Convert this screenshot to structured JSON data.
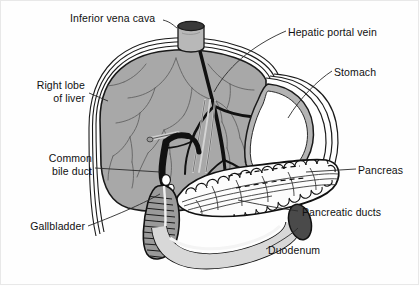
{
  "figure": {
    "type": "labeled-anatomical-illustration",
    "background_color": "#fefefe",
    "border_color": "#e8e8e8"
  },
  "palette": {
    "liver_fill": "#a8a8a8",
    "liver_outline": "#1a1a1a",
    "stomach_fill": "#ffffff",
    "stomach_rim": "#b4b4b4",
    "pancreas_fill": "#fcfcfc",
    "pancreas_outline": "#111111",
    "duodenum_fill": "#d8d8d8",
    "duodenum_dark": "#4a4a4a",
    "gallbladder_fill": "#9a9a9a",
    "vessel_dark": "#111111",
    "vessel_light": "#6a6a6a",
    "vena_cava_top": "#3a3a3a",
    "label_text": "#101010",
    "leader_line": "#2a2a2a"
  },
  "labels": [
    {
      "id": "inferior-vena-cava",
      "text": "Inferior vena cava",
      "lines": [
        "Inferior vena cava"
      ],
      "align": "left",
      "x": 70,
      "y": 18,
      "leader": "curved hook to vena cava cylinder"
    },
    {
      "id": "hepatic-portal-vein",
      "text": "Hepatic portal vein",
      "lines": [
        "Hepatic portal vein"
      ],
      "align": "left",
      "x": 288,
      "y": 26,
      "leader": "diagonal line down-left into liver hilum"
    },
    {
      "id": "right-lobe-of-liver",
      "text": "Right lobe of liver",
      "lines": [
        "Right lobe",
        "of liver"
      ],
      "align": "right",
      "x": 30,
      "y": 79,
      "leader": "short diagonal to liver surface"
    },
    {
      "id": "stomach",
      "text": "Stomach",
      "lines": [
        "Stomach"
      ],
      "align": "left",
      "x": 334,
      "y": 66,
      "leader": "diagonal line down-left to stomach body"
    },
    {
      "id": "common-bile-duct",
      "text": "Common bile duct",
      "lines": [
        "Common",
        "bile duct"
      ],
      "align": "right",
      "x": 18,
      "y": 152,
      "leader": "long horizontal line to bile duct"
    },
    {
      "id": "pancreas",
      "text": "Pancreas",
      "lines": [
        "Pancreas"
      ],
      "align": "left",
      "x": 358,
      "y": 164,
      "leader": "horizontal line left to pancreas body"
    },
    {
      "id": "gallbladder",
      "text": "Gallbladder",
      "lines": [
        "Gallbladder"
      ],
      "align": "right",
      "x": 18,
      "y": 220,
      "leader": "long shallow diagonal to gallbladder"
    },
    {
      "id": "pancreatic-ducts",
      "text": "Pancreatic ducts",
      "lines": [
        "Pancreatic ducts"
      ],
      "align": "left",
      "x": 300,
      "y": 206,
      "leader": "diagonal line up-left into pancreas ducts"
    },
    {
      "id": "duodenum",
      "text": "Duodenum",
      "lines": [
        "Duodenum"
      ],
      "align": "left",
      "x": 268,
      "y": 244,
      "leader": "diagonal line up-right to duodenum loop"
    }
  ],
  "structures": [
    {
      "id": "liver",
      "name": "Liver",
      "fill": "#a8a8a8",
      "description": "Large shield-shaped organ occupying the upper-left two thirds of the figure, with branching hepatic vessels"
    },
    {
      "id": "inferior-vena-cava-vessel",
      "name": "Inferior vena cava",
      "fill": "#3a3a3a",
      "description": "Short vertical cylinder rising from the superior surface of the liver with a dark elliptical cut end"
    },
    {
      "id": "hepatic-portal-vein-vessel",
      "name": "Hepatic portal vein",
      "fill": "#111111",
      "description": "Thick dark branching vessel tree entering the liver at the hilum"
    },
    {
      "id": "stomach",
      "name": "Stomach",
      "fill": "#ffffff",
      "description": "White teardrop-shaped organ with grey rim at the right of the liver"
    },
    {
      "id": "pancreas",
      "name": "Pancreas",
      "fill": "#fcfcfc",
      "description": "Elongated lobulated gland running diagonally across the lower-right with scalloped margins"
    },
    {
      "id": "pancreatic-ducts",
      "name": "Pancreatic ducts",
      "fill": "none",
      "description": "Fine branching duct lines running the length of the pancreas"
    },
    {
      "id": "common-bile-duct",
      "name": "Common bile duct",
      "fill": "#111111",
      "description": "Dark duct descending from the liver hilum toward the duodenum"
    },
    {
      "id": "gallbladder",
      "name": "Gallbladder",
      "fill": "#9a9a9a",
      "description": "Striated pear-shaped sac tucked under the liver's inferior margin"
    },
    {
      "id": "duodenum",
      "name": "Duodenum",
      "fill": "#d8d8d8",
      "description": "C-shaped tube curving below the pancreas with a dark oval cut end at the right"
    }
  ]
}
